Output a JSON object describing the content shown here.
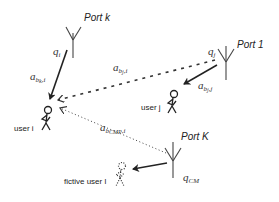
{
  "diagram": {
    "type": "wireless multi-port transmission diagram",
    "ports": [
      {
        "id": "port_k",
        "label": "Port k"
      },
      {
        "id": "port_1",
        "label": "Port 1"
      },
      {
        "id": "port_K",
        "label": "Port K"
      }
    ],
    "users": [
      {
        "id": "user_i",
        "label": "user i"
      },
      {
        "id": "user_j",
        "label": "user j"
      },
      {
        "id": "fictive_user_l",
        "label": "fictive user l"
      }
    ],
    "links": [
      {
        "from": "port_k",
        "to": "user_i",
        "style": "solid",
        "gain": {
          "base": "a",
          "sub": "b",
          "subsub": "k",
          "tail": ",i"
        },
        "precoder": {
          "base": "q",
          "sub": "i"
        }
      },
      {
        "from": "port_1",
        "to": "user_i",
        "style": "dashed",
        "gain": {
          "base": "a",
          "sub": "b",
          "subsub": "j",
          "tail": ",i"
        },
        "precoder": {
          "base": "q",
          "sub": "j"
        }
      },
      {
        "from": "port_1",
        "to": "user_j",
        "style": "solid",
        "gain": {
          "base": "a",
          "sub": "b",
          "subsub": "j",
          "tail": ",j"
        }
      },
      {
        "from": "port_K",
        "to": "user_i",
        "style": "dotted",
        "gain": {
          "base": "a",
          "sub": "b",
          "subsub": "CMP",
          "tail": ",i"
        }
      },
      {
        "from": "port_K",
        "to": "fictive_user_l",
        "style": "solid",
        "precoder": {
          "base": "q",
          "sub": "CM"
        }
      }
    ]
  }
}
